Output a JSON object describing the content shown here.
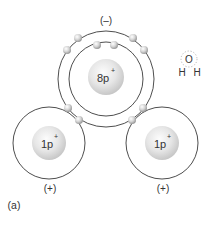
{
  "figure": {
    "panel_label": "(a)",
    "colors": {
      "orbit": "#3a3a3a",
      "nucleus_light": "#fafafa",
      "nucleus_dark": "#c8c8c8",
      "electron_light": "#ffffff",
      "electron_dark": "#9a9a9a",
      "text": "#333333"
    },
    "oxygen": {
      "nucleus_label": "8p",
      "nucleus_charge_sup": "+",
      "charge_label": "(–)",
      "center": [
        106,
        79
      ],
      "nucleus_radius": 18,
      "shells": [
        37,
        48
      ],
      "electrons": [
        {
          "shell": "inner",
          "x": 97,
          "y": 45
        },
        {
          "shell": "inner",
          "x": 114,
          "y": 45
        },
        {
          "shell": "outer",
          "x": 78,
          "y": 38
        },
        {
          "shell": "outer",
          "x": 67,
          "y": 50
        },
        {
          "shell": "outer",
          "x": 133,
          "y": 38
        },
        {
          "shell": "outer",
          "x": 144,
          "y": 50
        },
        {
          "shell": "shared",
          "x": 68,
          "y": 108
        },
        {
          "shell": "shared",
          "x": 79,
          "y": 120
        },
        {
          "shell": "shared",
          "x": 132,
          "y": 120
        },
        {
          "shell": "shared",
          "x": 143,
          "y": 108
        }
      ]
    },
    "hydrogens": [
      {
        "nucleus_label": "1p",
        "nucleus_charge_sup": "+",
        "charge_label": "(+)",
        "center": [
          49,
          143
        ],
        "shell_radius": 36,
        "nucleus_radius": 17
      },
      {
        "nucleus_label": "1p",
        "nucleus_charge_sup": "+",
        "charge_label": "(+)",
        "center": [
          162,
          143
        ],
        "shell_radius": 36,
        "nucleus_radius": 17
      }
    ],
    "molecule_icon": {
      "oxygen_symbol": "O",
      "hydrogen_symbol_left": "H",
      "hydrogen_symbol_right": "H"
    }
  }
}
